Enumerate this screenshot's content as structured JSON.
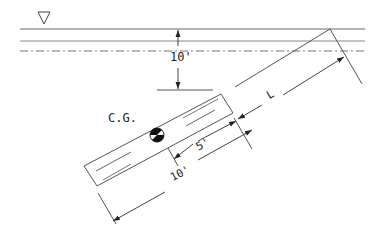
{
  "diagram": {
    "type": "inclined submerged gate",
    "labels": {
      "depth": "10'",
      "cg": "C.G.",
      "half_length": "5'",
      "gate_length": "10'",
      "hinge_distance": "L"
    },
    "symbols": {
      "free_surface": "triangle-down-icon",
      "centroid": "centroid-marker-icon"
    },
    "colors": {
      "line": "#555555",
      "text": "#222222",
      "background": "#ffffff"
    }
  }
}
